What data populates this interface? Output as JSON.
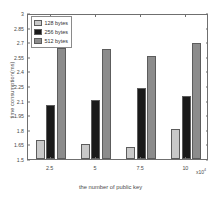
{
  "chart_data": {
    "type": "bar",
    "title": "",
    "xlabel": "the number of public key",
    "ylabel": "time consumption(ms)",
    "x_multiplier": "x10",
    "x_multiplier_exponent": "4",
    "categories": [
      "2.5",
      "5",
      "7.5",
      "10"
    ],
    "series": [
      {
        "name": "128 bytes",
        "color": "#c9c9c9",
        "values": [
          1.7,
          1.65,
          1.62,
          1.81
        ]
      },
      {
        "name": "256 bytes",
        "color": "#1a1a1a",
        "values": [
          2.06,
          2.11,
          2.23,
          2.15
        ]
      },
      {
        "name": "512 bytes",
        "color": "#8c8c8c",
        "values": [
          2.64,
          2.63,
          2.56,
          2.69
        ]
      }
    ],
    "ylim": [
      1.5,
      3.0
    ],
    "yticks": [
      "1.5",
      "1.65",
      "1.8",
      "1.95",
      "2.1",
      "2.25",
      "2.4",
      "2.55",
      "2.7",
      "2.85",
      "3"
    ],
    "ytick_values": [
      1.5,
      1.65,
      1.8,
      1.95,
      2.1,
      2.25,
      2.4,
      2.55,
      2.7,
      2.85,
      3.0
    ],
    "xticks": [
      "2.5",
      "5",
      "7.5",
      "10"
    ],
    "grid": false,
    "legend_position": "upper-left",
    "legend": [
      "128 bytes",
      "256 bytes",
      "512 bytes"
    ],
    "colors": {
      "axis": "#6f6f6f",
      "text": "#4a4a4a",
      "bar_edge": "#5c5c5c",
      "background": "#ffffff"
    }
  }
}
